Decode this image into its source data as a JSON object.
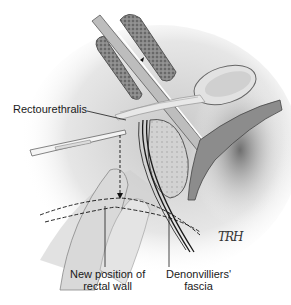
{
  "figure": {
    "type": "anatomical-illustration",
    "style": "grayscale pencil drawing",
    "labels": {
      "rectourethralis": "Rectourethralis",
      "new_position_line1": "New position of",
      "new_position_line2": "rectal wall",
      "denonvilliers_line1": "Denonvilliers'",
      "denonvilliers_line2": "fascia"
    },
    "signature": "TRH"
  },
  "colors": {
    "background": "#ffffff",
    "ink": "#1a1a1a",
    "shade_dark": "#5a5a5a",
    "shade_mid": "#9a9a9a",
    "shade_light": "#d6d6d6"
  }
}
